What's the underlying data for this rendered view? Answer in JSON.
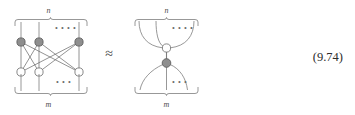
{
  "figure": {
    "kind": "tensor-network-diagram",
    "equation_number": "(9.74)",
    "relation_symbol": "≈",
    "colors": {
      "stroke": "#7d7d7d",
      "shaded_node_fill": "#8e8e8e",
      "shaded_node_stroke": "#5f5f5f",
      "open_node_fill": "#ffffff",
      "open_node_stroke": "#7a7a7a",
      "text": "#3a3a3a",
      "background": "#ffffff"
    },
    "left_diagram": {
      "top_label": "n",
      "bottom_label": "m",
      "top_dots": "• • • •",
      "bottom_dots": "• • •",
      "top_row_node_count": 3,
      "bottom_row_node_count": 3,
      "top_row_node_style": "shaded",
      "bottom_row_node_style": "open",
      "connectivity": "complete-bipartite",
      "leg_count_top": 3,
      "leg_count_bottom": 3
    },
    "right_diagram": {
      "top_label": "n",
      "bottom_label": "m",
      "top_dots": "• • • •",
      "bottom_dots": "• • •",
      "upper_node_style": "open",
      "lower_node_style": "shaded",
      "upper_fan_legs": 3,
      "lower_fan_legs": 3,
      "shape": "hourglass"
    }
  }
}
